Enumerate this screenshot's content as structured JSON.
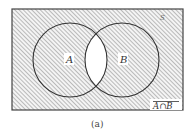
{
  "diagram": {
    "type": "venn",
    "universe_label": "S",
    "sets": [
      {
        "name": "A",
        "label": "A"
      },
      {
        "name": "B",
        "label": "B"
      }
    ],
    "shaded_region": "complement of A∩B",
    "region_label": "A∩B",
    "caption": "(a)",
    "colors": {
      "stroke": "#333333",
      "hatch": "#8a8a8a",
      "background": "#ffffff"
    }
  }
}
